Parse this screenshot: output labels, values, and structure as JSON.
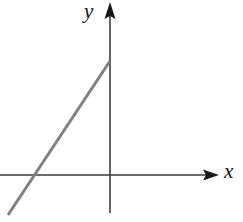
{
  "figure": {
    "title": "",
    "background_color": "#ffffff",
    "width": 243,
    "height": 222
  },
  "axes": {
    "x_axis": {
      "label": "x",
      "color": "#3a3a3a",
      "stroke_width": 1.4,
      "start": [
        0,
        175
      ],
      "end": [
        219,
        175
      ],
      "arrow": "right",
      "arrow_tip": [
        219,
        175
      ],
      "label_position": [
        224,
        161
      ]
    },
    "y_axis": {
      "label": "y",
      "color": "#3a3a3a",
      "stroke_width": 1.6,
      "start": [
        110,
        213
      ],
      "end": [
        110,
        2
      ],
      "arrow": "up",
      "arrow_tip": [
        110,
        2
      ],
      "label_position": [
        84,
        1
      ]
    }
  },
  "chart_data": {
    "type": "line",
    "title": "",
    "xlabel": "x",
    "ylabel": "y",
    "grid": false,
    "legend": null,
    "origin_px": [
      110,
      175
    ],
    "series": [
      {
        "name": "line",
        "color": "#808080",
        "stroke_width": 3,
        "description": "straight line with positive slope",
        "points_px": [
          [
            8,
            215
          ],
          [
            110,
            61
          ]
        ],
        "x_intercept_px": [
          31,
          175
        ],
        "y_intercept_px": [
          110,
          61
        ],
        "slope_sign": "positive"
      }
    ]
  },
  "colors": {
    "line": "#808080",
    "axis": "#3a3a3a",
    "label": "#111111",
    "background": "#ffffff"
  }
}
